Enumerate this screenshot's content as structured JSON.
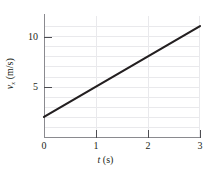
{
  "chart_data": {
    "type": "line",
    "title": "",
    "xlabel": "t (s)",
    "ylabel": "v_x (m/s)",
    "ylabel_symbol": "v",
    "ylabel_subscript": "x",
    "ylabel_units": "(m/s)",
    "xlabel_symbol": "t",
    "xlabel_units": "(s)",
    "x": [
      0,
      3
    ],
    "values": [
      2,
      11
    ],
    "series": [
      {
        "name": "v_x",
        "x": [
          0,
          3
        ],
        "values": [
          2,
          11
        ]
      }
    ],
    "slope": 3,
    "intercept": 2,
    "xlim": [
      0,
      3
    ],
    "ylim": [
      0,
      12
    ],
    "grid": true,
    "legend": "none",
    "line_color": "#231f20",
    "grid_color": "#e9e9ec",
    "axis_color": "#8a8a8f",
    "xticks": [
      {
        "value": 0,
        "label": "0"
      },
      {
        "value": 1,
        "label": "1"
      },
      {
        "value": 2,
        "label": "2"
      },
      {
        "value": 3,
        "label": "3"
      }
    ],
    "yticks": [
      {
        "value": 5,
        "label": "5"
      },
      {
        "value": 10,
        "label": "10"
      }
    ],
    "y_gridline_values": [
      1,
      2,
      3,
      4,
      5,
      6,
      7,
      8,
      9,
      10,
      11
    ],
    "x_gridline_values": [
      1,
      2,
      3
    ]
  }
}
